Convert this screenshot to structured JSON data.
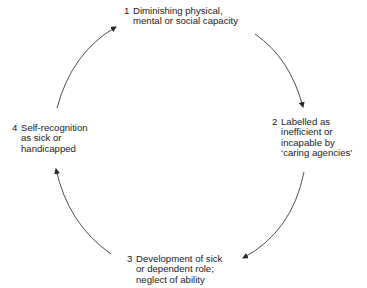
{
  "diagram": {
    "type": "cycle",
    "nodes": [
      {
        "number": "1",
        "lines": [
          "Diminishing physical,",
          "mental or social capacity"
        ]
      },
      {
        "number": "2",
        "lines": [
          "Labelled as",
          "inefficient or",
          "incapable by",
          "‘caring agencies’"
        ]
      },
      {
        "number": "3",
        "lines": [
          "Development of sick",
          "or dependent role;",
          "neglect of ability"
        ]
      },
      {
        "number": "4",
        "lines": [
          "Self-recognition",
          "as sick or",
          "handicapped"
        ]
      }
    ],
    "edges": [
      {
        "from": "4",
        "to": "1"
      },
      {
        "from": "1",
        "to": "2"
      },
      {
        "from": "2",
        "to": "3"
      },
      {
        "from": "3",
        "to": "4"
      }
    ],
    "colors": {
      "line": "#3a3a3a",
      "text": "#1a1a1a",
      "background": "#ffffff"
    }
  }
}
